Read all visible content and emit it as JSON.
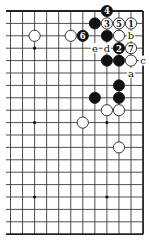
{
  "diagram": {
    "type": "go-board-fragment",
    "visible_columns": 12,
    "visible_rows": 19,
    "edges": [
      "top",
      "right",
      "bottom"
    ],
    "hoshi": [
      {
        "c": 2,
        "r": 3
      },
      {
        "c": 8,
        "r": 3
      },
      {
        "c": 2,
        "r": 9
      },
      {
        "c": 8,
        "r": 9
      },
      {
        "c": 2,
        "r": 15
      },
      {
        "c": 8,
        "r": 15
      }
    ],
    "stones": [
      {
        "c": 8,
        "r": 0,
        "color": "black",
        "label": "4"
      },
      {
        "c": 7,
        "r": 1,
        "color": "black",
        "label": ""
      },
      {
        "c": 8,
        "r": 1,
        "color": "white",
        "label": "3"
      },
      {
        "c": 9,
        "r": 1,
        "color": "white",
        "label": "5"
      },
      {
        "c": 10,
        "r": 1,
        "color": "white",
        "label": "1"
      },
      {
        "c": 2,
        "r": 2,
        "color": "white",
        "label": ""
      },
      {
        "c": 5,
        "r": 2,
        "color": "white",
        "label": ""
      },
      {
        "c": 6,
        "r": 2,
        "color": "black",
        "label": "6"
      },
      {
        "c": 8,
        "r": 2,
        "color": "black",
        "label": ""
      },
      {
        "c": 9,
        "r": 2,
        "color": "white",
        "label": ""
      },
      {
        "c": 9,
        "r": 3,
        "color": "black",
        "label": "2"
      },
      {
        "c": 10,
        "r": 3,
        "color": "white",
        "label": "7"
      },
      {
        "c": 8,
        "r": 4,
        "color": "black",
        "label": ""
      },
      {
        "c": 9,
        "r": 4,
        "color": "black",
        "label": ""
      },
      {
        "c": 10,
        "r": 4,
        "color": "white",
        "label": ""
      },
      {
        "c": 9,
        "r": 6,
        "color": "black",
        "label": ""
      },
      {
        "c": 7,
        "r": 7,
        "color": "black",
        "label": ""
      },
      {
        "c": 9,
        "r": 7,
        "color": "black",
        "label": ""
      },
      {
        "c": 8,
        "r": 8,
        "color": "white",
        "label": ""
      },
      {
        "c": 9,
        "r": 8,
        "color": "white",
        "label": ""
      },
      {
        "c": 6,
        "r": 9,
        "color": "white",
        "label": ""
      },
      {
        "c": 9,
        "r": 11,
        "color": "white",
        "label": ""
      }
    ],
    "letters": [
      {
        "c": 10,
        "r": 2,
        "text": "b"
      },
      {
        "c": 7,
        "r": 3,
        "text": "e"
      },
      {
        "c": 8,
        "r": 3,
        "text": "d"
      },
      {
        "c": 11,
        "r": 4,
        "text": "c"
      },
      {
        "c": 10,
        "r": 5,
        "text": "a"
      }
    ],
    "colors": {
      "black_stone": "#111111",
      "white_stone": "#ffffff",
      "line": "#3a3a3a",
      "background": "#ffffff"
    }
  }
}
